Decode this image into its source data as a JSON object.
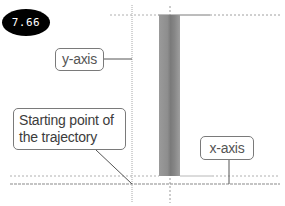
{
  "badge": {
    "value": "7.66",
    "background_color": "#000000",
    "text_color": "#ffffff"
  },
  "callouts": {
    "y_axis": {
      "label": "y-axis"
    },
    "start": {
      "line1": "Starting point of",
      "line2": "the trajectory"
    },
    "x_axis": {
      "label": "x-axis"
    }
  },
  "diagram": {
    "bar_color": "#8a8a8a",
    "axis_line_color": "#999999",
    "leader_line_color": "#555555"
  }
}
